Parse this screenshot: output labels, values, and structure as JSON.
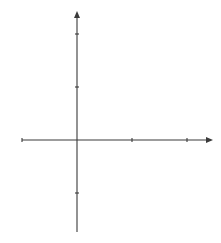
{
  "chart_data": {
    "type": "line",
    "title": "",
    "xlabel": "x",
    "ylabel": "y",
    "origin_label": "O",
    "xlim": [
      -2,
      4.5
    ],
    "ylim": [
      -3.5,
      4.8
    ],
    "grid": true,
    "grid_step": 0.5,
    "x_ticks": [
      -2,
      2,
      4
    ],
    "y_ticks": [
      4,
      2,
      -2
    ],
    "x_tick_labels": [
      "−2",
      "2",
      "4"
    ],
    "y_tick_labels": [
      "4",
      "2",
      "−2"
    ],
    "annotation": "y = (x − 1)²(3 − x)",
    "series": [
      {
        "name": "y = (x − 1)²(3 − x)",
        "x": [
          -0.2,
          -0.1,
          0,
          0.2,
          0.4,
          0.6,
          0.8,
          1.0,
          1.2,
          1.4,
          1.6,
          1.8,
          2.0,
          2.2,
          2.333,
          2.5,
          2.7,
          2.9,
          3.0,
          3.1,
          3.2,
          3.3,
          3.4,
          3.47
        ],
        "y": [
          4.608,
          3.751,
          3,
          1.792,
          0.936,
          0.384,
          0.088,
          0,
          0.072,
          0.256,
          0.504,
          0.768,
          1,
          1.152,
          1.185,
          1.125,
          0.867,
          0.361,
          0,
          -0.441,
          -0.968,
          -1.587,
          -2.304,
          -2.883
        ]
      }
    ],
    "key_points": {
      "y_intercept": [
        0,
        3
      ],
      "double_root": [
        1,
        0
      ],
      "root": [
        3,
        0
      ],
      "local_max": [
        2.333,
        1.185
      ]
    }
  }
}
